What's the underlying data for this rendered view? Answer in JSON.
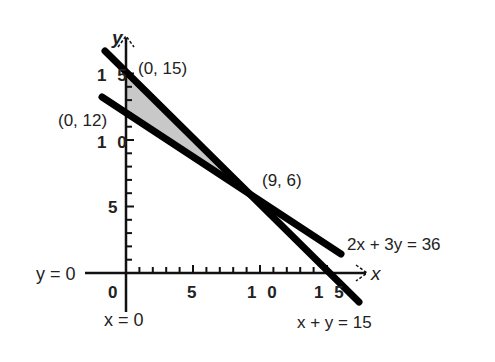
{
  "diagram": {
    "type": "linear-programming-graph",
    "axes": {
      "x_label": "x",
      "y_label": "y",
      "x_axis_caption": "y = 0",
      "y_axis_caption": "x = 0",
      "origin_label": "0",
      "x_tick_labels": [
        "5",
        "1 0",
        "1 5"
      ],
      "y_tick_labels": [
        "5",
        "1 0",
        "1 5"
      ],
      "x_ticks": [
        5,
        10,
        15
      ],
      "y_ticks": [
        5,
        10,
        15
      ]
    },
    "lines": [
      {
        "equation": "2x + 3y = 36",
        "label": "2x + 3y = 36"
      },
      {
        "equation": "x + y = 15",
        "label": "x + y = 15"
      }
    ],
    "points": [
      {
        "label": "(0, 15)",
        "x": 0,
        "y": 15
      },
      {
        "label": "(0, 12)",
        "x": 0,
        "y": 12
      },
      {
        "label": "(9, 6)",
        "x": 9,
        "y": 6
      }
    ],
    "shaded_region": {
      "vertices": [
        [
          0,
          15
        ],
        [
          0,
          12
        ],
        [
          9,
          6
        ]
      ],
      "color": "#c8c8c8"
    },
    "colors": {
      "line": "#000000",
      "axis": "#111111",
      "shade": "#c8c8c8"
    }
  }
}
